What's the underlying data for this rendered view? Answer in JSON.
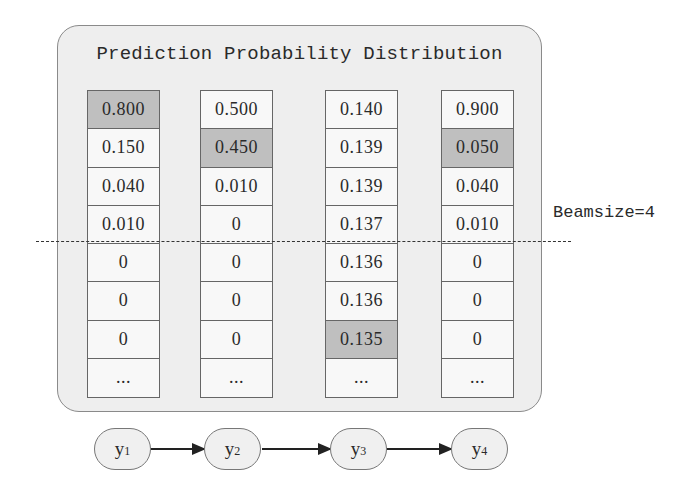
{
  "title": "Prediction Probability Distribution",
  "beam": {
    "label": "Beamsize=4",
    "after_row": 4
  },
  "colors": {
    "panel_bg": "#eeeeee",
    "cell_bg": "#f8f8f8",
    "highlight": "#bfbfbf",
    "border": "#666666"
  },
  "columns": [
    {
      "step": "y1",
      "cells": [
        {
          "v": "0.800",
          "hl": true
        },
        {
          "v": "0.150"
        },
        {
          "v": "0.040"
        },
        {
          "v": "0.010"
        },
        {
          "v": "0"
        },
        {
          "v": "0"
        },
        {
          "v": "0"
        },
        {
          "v": "..."
        }
      ]
    },
    {
      "step": "y2",
      "cells": [
        {
          "v": "0.500"
        },
        {
          "v": "0.450",
          "hl": true
        },
        {
          "v": "0.010"
        },
        {
          "v": "0"
        },
        {
          "v": "0"
        },
        {
          "v": "0"
        },
        {
          "v": "0"
        },
        {
          "v": "..."
        }
      ]
    },
    {
      "step": "y3",
      "cells": [
        {
          "v": "0.140"
        },
        {
          "v": "0.139"
        },
        {
          "v": "0.139"
        },
        {
          "v": "0.137"
        },
        {
          "v": "0.136"
        },
        {
          "v": "0.136"
        },
        {
          "v": "0.135",
          "hl": true
        },
        {
          "v": "..."
        }
      ]
    },
    {
      "step": "y4",
      "cells": [
        {
          "v": "0.900"
        },
        {
          "v": "0.050",
          "hl": true
        },
        {
          "v": "0.040"
        },
        {
          "v": "0.010"
        },
        {
          "v": "0"
        },
        {
          "v": "0"
        },
        {
          "v": "0"
        },
        {
          "v": "..."
        }
      ]
    }
  ],
  "nodes": [
    {
      "base": "y",
      "sub": "1"
    },
    {
      "base": "y",
      "sub": "2"
    },
    {
      "base": "y",
      "sub": "3"
    },
    {
      "base": "y",
      "sub": "4"
    }
  ]
}
